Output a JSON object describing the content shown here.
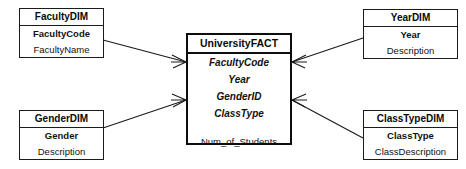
{
  "diagram": {
    "type": "star-schema",
    "colors": {
      "border": "#1b1b1b",
      "fact_border": "#0d0d0d",
      "background": "#ffffff",
      "text": "#111111",
      "line": "#1a1a1a"
    }
  },
  "fact_table": {
    "name": "UniversityFACT",
    "keys": [
      "FacultyCode",
      "Year",
      "GenderID",
      "ClassType"
    ],
    "measures": [
      "Num_of_Students"
    ]
  },
  "dimensions": [
    {
      "name": "FacultyDIM",
      "key": "FacultyCode",
      "attributes": [
        "FacultyName"
      ]
    },
    {
      "name": "GenderDIM",
      "key": "Gender",
      "attributes": [
        "Description"
      ]
    },
    {
      "name": "YearDIM",
      "key": "Year",
      "attributes": [
        "Description"
      ]
    },
    {
      "name": "ClassTypeDIM",
      "key": "ClassType",
      "attributes": [
        "ClassDescription"
      ]
    }
  ],
  "relationships": [
    {
      "from": "FacultyDIM",
      "to": "UniversityFACT",
      "cardinality": "one-to-many"
    },
    {
      "from": "GenderDIM",
      "to": "UniversityFACT",
      "cardinality": "one-to-many"
    },
    {
      "from": "YearDIM",
      "to": "UniversityFACT",
      "cardinality": "one-to-many"
    },
    {
      "from": "ClassTypeDIM",
      "to": "UniversityFACT",
      "cardinality": "one-to-many"
    }
  ]
}
